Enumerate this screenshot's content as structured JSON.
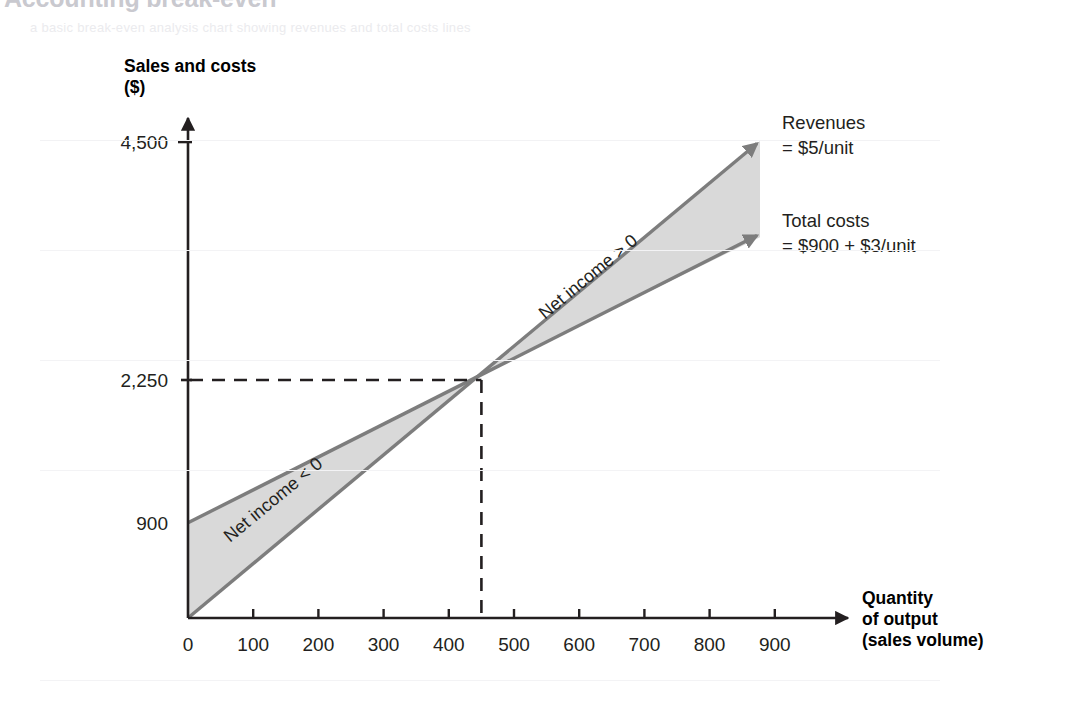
{
  "page": {
    "title": "Accounting break-even",
    "ghost_subtitle": "a basic break-even analysis chart showing revenues and total costs lines",
    "background": "#ffffff"
  },
  "colors": {
    "fill_gray": "#d9d9d9",
    "line_gray": "#808080",
    "axis_black": "#231f20",
    "text_black": "#231f20",
    "ghost_gray": "#c9c9cf"
  },
  "axes": {
    "y_title": "Sales and costs\n($)",
    "x_title": "Quantity\nof output\n(sales volume)"
  },
  "annotations": {
    "revenues": "Revenues\n= $5/unit",
    "total_costs": "Total costs\n= $900 + $3/unit",
    "net_income_positive": "Net income > 0",
    "net_income_negative": "Net income < 0"
  },
  "chart_data": {
    "type": "line",
    "title": "Accounting break-even",
    "xlabel": "Quantity of output (sales volume)",
    "ylabel": "Sales and costs ($)",
    "xlim": [
      0,
      900
    ],
    "ylim": [
      0,
      4800
    ],
    "grid": false,
    "legend": "annotated-at-line-ends",
    "x_ticks": [
      0,
      100,
      200,
      300,
      400,
      500,
      600,
      700,
      800,
      900
    ],
    "x_tick_labels": [
      "0",
      "100",
      "200",
      "300",
      "400",
      "500",
      "600",
      "700",
      "800",
      "900"
    ],
    "y_ticks": [
      900,
      2250,
      4500
    ],
    "y_tick_labels": [
      "900",
      "2,250",
      "4,500"
    ],
    "series": [
      {
        "name": "Revenues",
        "formula": "= $5/unit",
        "slope": 5,
        "intercept": 0,
        "x": [
          0,
          900
        ],
        "values": [
          0,
          4500
        ],
        "arrow_end": true
      },
      {
        "name": "Total costs",
        "formula": "= $900 + $3/unit",
        "slope": 3,
        "intercept": 900,
        "x": [
          0,
          900
        ],
        "values": [
          900,
          3600
        ],
        "arrow_end": true
      }
    ],
    "break_even": {
      "x": 450,
      "y": 2250,
      "x_label": "450",
      "y_label": "2,250",
      "dashed_guides": true
    },
    "shaded_regions": [
      {
        "name": "Net income < 0",
        "x_range": [
          0,
          450
        ],
        "between": [
          "Revenues",
          "Total costs"
        ],
        "fill": "#d9d9d9"
      },
      {
        "name": "Net income > 0",
        "x_range": [
          450,
          900
        ],
        "between": [
          "Revenues",
          "Total costs"
        ],
        "fill": "#d9d9d9"
      }
    ]
  }
}
